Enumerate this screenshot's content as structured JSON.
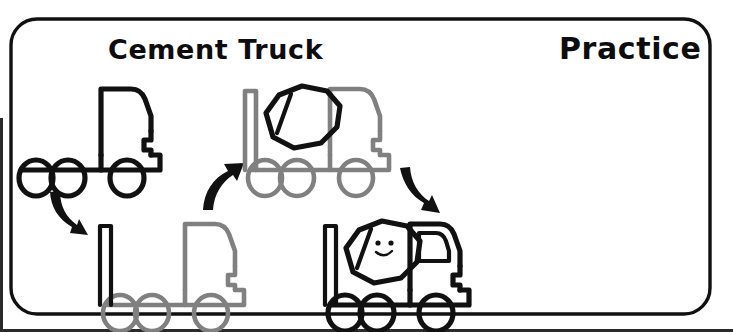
{
  "page": {
    "type": "drawing-tutorial-worksheet",
    "width": 733,
    "height": 332,
    "background_color": "#ffffff",
    "border_color": "#111111",
    "subject": "Cement Truck"
  },
  "header": {
    "title": "Cement Truck",
    "title_color": "#0d0d0d",
    "mode_label": "Practice",
    "mode_label_color": "#0d0d0d"
  },
  "palette": {
    "ink_black": "#111111",
    "previous_step_gray": "#808080",
    "paper_white": "#ffffff"
  },
  "steps": [
    {
      "index": 1,
      "name": "step-1-chassis-and-cab",
      "position": "top-left",
      "new_parts_color": "#111111",
      "previous_parts_color": null,
      "description": "Flat chassis with cab and three wheels",
      "wheel_count": 3,
      "has_mixer_drum": false,
      "has_rear_post": false,
      "has_face": false,
      "has_cab_window": false
    },
    {
      "index": 2,
      "name": "step-2-add-rear-post",
      "position": "bottom-left",
      "new_parts_color": "#111111",
      "previous_parts_color": "#808080",
      "description": "Add tall vertical post at rear of chassis",
      "wheel_count": 3,
      "has_mixer_drum": false,
      "has_rear_post": true,
      "has_face": false,
      "has_cab_window": false
    },
    {
      "index": 3,
      "name": "step-3-add-mixer-drum",
      "position": "top-middle",
      "new_parts_color": "#111111",
      "previous_parts_color": "#808080",
      "description": "Add tilted octagonal mixer drum with band",
      "wheel_count": 3,
      "has_mixer_drum": true,
      "has_rear_post": true,
      "has_face": false,
      "has_cab_window": false
    },
    {
      "index": 4,
      "name": "step-4-finished-cement-truck",
      "position": "bottom-right",
      "new_parts_color": "#111111",
      "previous_parts_color": null,
      "description": "Completed cement truck with cab window and smiley face on drum",
      "wheel_count": 3,
      "has_mixer_drum": true,
      "has_rear_post": true,
      "has_face": true,
      "has_cab_window": true
    }
  ],
  "arrows": [
    {
      "name": "arrow-step1-to-step2",
      "direction": "down-right",
      "from_step": 1,
      "to_step": 2,
      "color": "#111111"
    },
    {
      "name": "arrow-step2-to-step3",
      "direction": "up-right",
      "from_step": 2,
      "to_step": 3,
      "color": "#111111"
    },
    {
      "name": "arrow-step3-to-step4",
      "direction": "down-right",
      "from_step": 3,
      "to_step": 4,
      "color": "#111111"
    }
  ],
  "face": {
    "name": "smiley-face",
    "eyes": 2,
    "expression": "smile"
  }
}
